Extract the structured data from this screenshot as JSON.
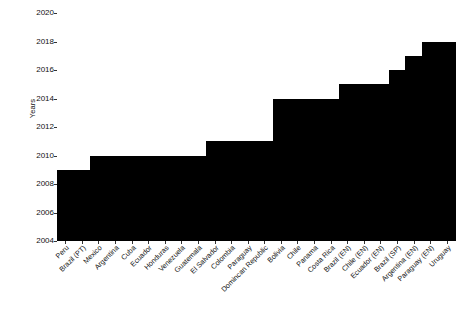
{
  "chart_data": {
    "type": "bar",
    "title": "",
    "subtitle": "",
    "xlabel": "",
    "ylabel": "Years",
    "ylim": [
      2004,
      2020
    ],
    "ytick_values": [
      2004,
      2006,
      2008,
      2010,
      2012,
      2014,
      2016,
      2018,
      2020
    ],
    "ytick_labels": [
      "2004",
      "2006",
      "2008",
      "2010",
      "2012",
      "2014",
      "2016",
      "2018",
      "2020"
    ],
    "grid": false,
    "legend": false,
    "bar_color": "#000000",
    "background_color": "#ffffff",
    "baseline": 2004,
    "categories": [
      "Peru",
      "Brazil (PT)",
      "Mexico",
      "Argentina",
      "Cuba",
      "Ecuador",
      "Honduras",
      "Venezuela",
      "Guatemala",
      "El Salvador",
      "Colombia",
      "Paraguay",
      "Domincan Republic",
      "Bolivia",
      "Chile",
      "Panama",
      "Costa Rica",
      "Brazil (EN)",
      "Chile (EN)",
      "Ecuador (EN)",
      "Brazil (SP)",
      "Argentina (EN)",
      "Paraguay (EN)",
      "Uruguay"
    ],
    "values": [
      2009,
      2009,
      2010,
      2010,
      2010,
      2010,
      2010,
      2010,
      2010,
      2011,
      2011,
      2011,
      2011,
      2014,
      2014,
      2014,
      2014,
      2015,
      2015,
      2015,
      2016,
      2017,
      2018,
      2018
    ]
  }
}
